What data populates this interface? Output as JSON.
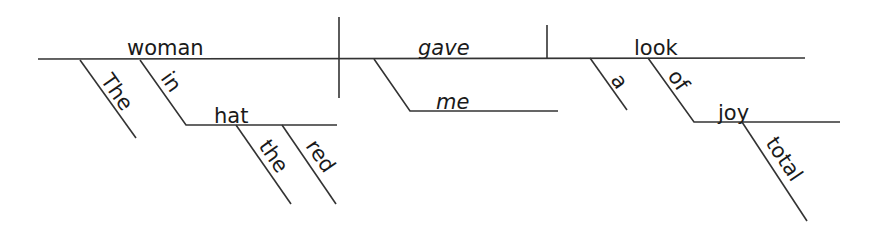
{
  "diagram": {
    "type": "sentence-diagram",
    "sentence_words": {
      "subject": "woman",
      "verb": "gave",
      "direct_object": "look",
      "subject_article": "The",
      "subject_preposition": "in",
      "prep_object": "hat",
      "prep_object_article": "the",
      "prep_object_adjective": "red",
      "indirect_object": "me",
      "object_article": "a",
      "object_preposition": "of",
      "object_prep_object": "joy",
      "object_prep_object_adjective": "total"
    },
    "colors": {
      "line": "#333333",
      "text": "#1a1a1a",
      "background": "#ffffff"
    }
  }
}
